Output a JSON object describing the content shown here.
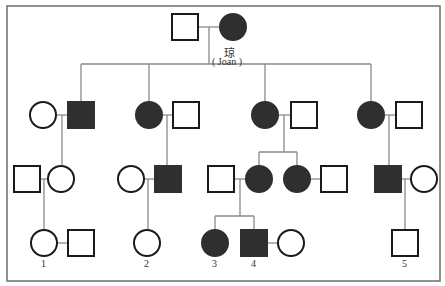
{
  "diagram": {
    "type": "pedigree",
    "colors": {
      "affected": "#2f2f2f",
      "unaffected": "#ffffff",
      "line": "#8a8a8a",
      "stroke": "#1a1a1a"
    },
    "proband_label": {
      "chinese": "琼",
      "english": "( Joan )"
    },
    "numbers": [
      "1",
      "2",
      "3",
      "4",
      "5"
    ],
    "individuals": [
      {
        "id": "I-1",
        "sex": "male",
        "affected": false,
        "x": 185,
        "y": 27
      },
      {
        "id": "I-2",
        "sex": "female",
        "affected": true,
        "x": 233,
        "y": 27,
        "name": "Joan"
      },
      {
        "id": "II-1",
        "sex": "female",
        "affected": false,
        "x": 43,
        "y": 115
      },
      {
        "id": "II-2",
        "sex": "male",
        "affected": true,
        "x": 81,
        "y": 115
      },
      {
        "id": "II-3",
        "sex": "female",
        "affected": true,
        "x": 149,
        "y": 115
      },
      {
        "id": "II-4",
        "sex": "male",
        "affected": false,
        "x": 186,
        "y": 115
      },
      {
        "id": "II-5",
        "sex": "female",
        "affected": true,
        "x": 265,
        "y": 115
      },
      {
        "id": "II-6",
        "sex": "male",
        "affected": false,
        "x": 304,
        "y": 115
      },
      {
        "id": "II-7",
        "sex": "female",
        "affected": true,
        "x": 371,
        "y": 115
      },
      {
        "id": "II-8",
        "sex": "male",
        "affected": false,
        "x": 409,
        "y": 115
      },
      {
        "id": "III-1",
        "sex": "male",
        "affected": false,
        "x": 27,
        "y": 179
      },
      {
        "id": "III-2",
        "sex": "female",
        "affected": false,
        "x": 61,
        "y": 179
      },
      {
        "id": "III-3",
        "sex": "female",
        "affected": false,
        "x": 131,
        "y": 179
      },
      {
        "id": "III-4",
        "sex": "male",
        "affected": true,
        "x": 168,
        "y": 179
      },
      {
        "id": "III-5",
        "sex": "male",
        "affected": false,
        "x": 221,
        "y": 179
      },
      {
        "id": "III-6",
        "sex": "female",
        "affected": true,
        "x": 259,
        "y": 179
      },
      {
        "id": "III-7",
        "sex": "female",
        "affected": true,
        "x": 297,
        "y": 179
      },
      {
        "id": "III-8",
        "sex": "male",
        "affected": false,
        "x": 334,
        "y": 179
      },
      {
        "id": "III-9",
        "sex": "male",
        "affected": true,
        "x": 388,
        "y": 179
      },
      {
        "id": "III-10",
        "sex": "female",
        "affected": false,
        "x": 424,
        "y": 179
      },
      {
        "id": "IV-1",
        "sex": "female",
        "affected": false,
        "x": 44,
        "y": 243,
        "number": "1"
      },
      {
        "id": "IV-2",
        "sex": "male",
        "affected": false,
        "x": 81,
        "y": 243
      },
      {
        "id": "IV-3",
        "sex": "female",
        "affected": false,
        "x": 147,
        "y": 243,
        "number": "2"
      },
      {
        "id": "IV-4",
        "sex": "female",
        "affected": true,
        "x": 215,
        "y": 243,
        "number": "3"
      },
      {
        "id": "IV-5",
        "sex": "male",
        "affected": true,
        "x": 254,
        "y": 243,
        "number": "4"
      },
      {
        "id": "IV-6",
        "sex": "female",
        "affected": false,
        "x": 291,
        "y": 243
      },
      {
        "id": "IV-7",
        "sex": "male",
        "affected": false,
        "x": 405,
        "y": 243,
        "number": "5"
      }
    ]
  }
}
